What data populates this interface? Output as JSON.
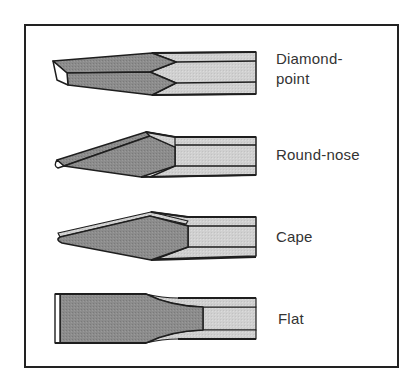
{
  "figure": {
    "title": "",
    "colors": {
      "frame": "#222222",
      "outline": "#1e1e1e",
      "blade_face_dark": "#8a8a8a",
      "shank_light": "#cdcdcd",
      "bevel_highlight": "#ffffff",
      "label_text": "#333333"
    },
    "chisels": [
      {
        "id": "diamond-point",
        "label_line1": "Diamond-",
        "label_line2": "point"
      },
      {
        "id": "round-nose",
        "label": "Round-nose"
      },
      {
        "id": "cape",
        "label": "Cape"
      },
      {
        "id": "flat",
        "label": "Flat"
      }
    ]
  }
}
